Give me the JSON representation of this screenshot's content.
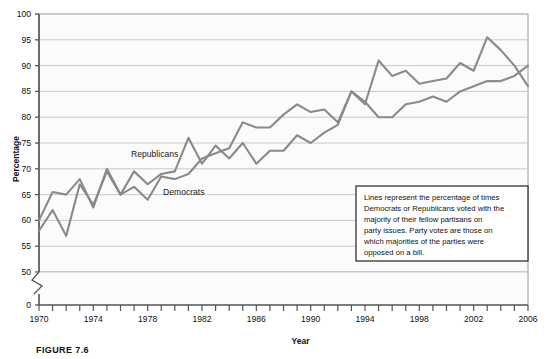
{
  "figure": {
    "caption": "FIGURE 7.6",
    "xlabel": "Year",
    "ylabel": "Percentage"
  },
  "annotation": {
    "name": "note-box",
    "lines": [
      "Lines represent the percentage of times",
      "Democrats or Republicans voted with the",
      "majority of their fellow partisans on",
      "party issues. Party votes are those on",
      "which majorities of the parties were",
      "opposed on a bill."
    ]
  },
  "colors": {
    "line": "#8a8a8a",
    "line_dark": "#7d7d7d",
    "grid": "#c9c9c9",
    "axis": "#555555",
    "plot_background": "#fbfbfb",
    "plot_border": "#9a9a9a",
    "note_border": "#222222",
    "note_background": "#ffffff"
  },
  "chart_data": {
    "type": "line",
    "title": "",
    "xlabel": "Year",
    "ylabel": "Percentage",
    "xlim": [
      1970,
      2006
    ],
    "ylim": [
      50,
      100
    ],
    "y_axis_break": true,
    "y_break_from": 0,
    "y_break_to": 50,
    "yticks": [
      0,
      50,
      55,
      60,
      65,
      70,
      75,
      80,
      85,
      90,
      95,
      100
    ],
    "xticks_labeled": [
      1970,
      1974,
      1978,
      1982,
      1986,
      1990,
      1994,
      1998,
      2002,
      2006
    ],
    "xtick_interval": 1,
    "grid": "horizontal",
    "legend_position": "inline-labels",
    "x": [
      1970,
      1971,
      1972,
      1973,
      1974,
      1975,
      1976,
      1977,
      1978,
      1979,
      1980,
      1981,
      1982,
      1983,
      1984,
      1985,
      1986,
      1987,
      1988,
      1989,
      1990,
      1991,
      1992,
      1993,
      1994,
      1995,
      1996,
      1997,
      1998,
      1999,
      2000,
      2001,
      2002,
      2003,
      2004,
      2005,
      2006
    ],
    "series": [
      {
        "name": "Republicans",
        "label": "Republicans",
        "values": [
          60,
          65.5,
          65,
          68,
          62.5,
          70,
          65,
          69.5,
          67,
          69,
          69.5,
          76,
          71,
          74.5,
          72,
          75,
          71,
          73.5,
          73.5,
          76.5,
          75,
          77,
          78.5,
          85,
          82.5,
          91,
          88,
          89,
          86.5,
          87,
          87.5,
          90.5,
          89,
          95.5,
          93,
          90,
          86
        ]
      },
      {
        "name": "Democrats",
        "label": "Democrats",
        "values": [
          58,
          62,
          57,
          67,
          63,
          69.5,
          65,
          66.5,
          64,
          68.5,
          68,
          69,
          72,
          73,
          74,
          79,
          78,
          78,
          80.5,
          82.5,
          81,
          81.5,
          79,
          85,
          83,
          80,
          80,
          82.5,
          83,
          84,
          83,
          85,
          86,
          87,
          87,
          88,
          90
        ]
      }
    ],
    "series_label_positions": [
      {
        "name": "Republicans",
        "x_px": 131,
        "y_px": 157
      },
      {
        "name": "Democrats",
        "x_px": 163,
        "y_px": 195
      }
    ]
  }
}
